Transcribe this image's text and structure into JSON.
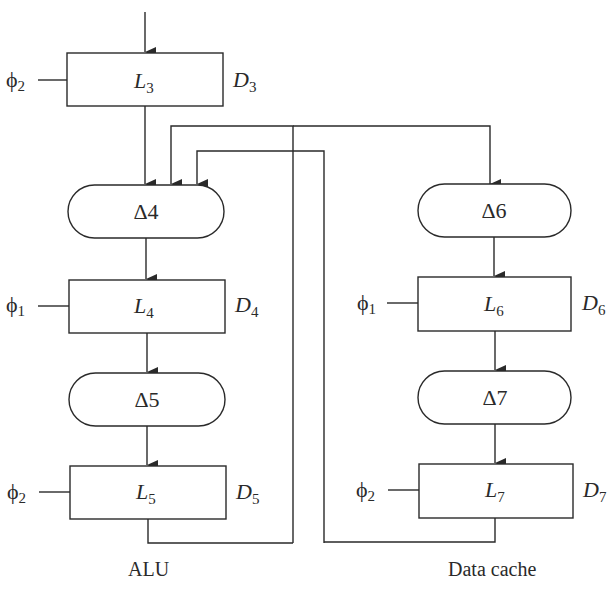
{
  "diagram": {
    "latches": [
      {
        "id": "L3",
        "label": "L",
        "sub": "3",
        "delay_label": "D",
        "delay_sub": "3",
        "clock": "ϕ",
        "clock_sub": "2"
      },
      {
        "id": "L4",
        "label": "L",
        "sub": "4",
        "delay_label": "D",
        "delay_sub": "4",
        "clock": "ϕ",
        "clock_sub": "1"
      },
      {
        "id": "L5",
        "label": "L",
        "sub": "5",
        "delay_label": "D",
        "delay_sub": "5",
        "clock": "ϕ",
        "clock_sub": "2"
      },
      {
        "id": "L6",
        "label": "L",
        "sub": "6",
        "delay_label": "D",
        "delay_sub": "6",
        "clock": "ϕ",
        "clock_sub": "1"
      },
      {
        "id": "L7",
        "label": "L",
        "sub": "7",
        "delay_label": "D",
        "delay_sub": "7",
        "clock": "ϕ",
        "clock_sub": "2"
      }
    ],
    "logic_blocks": [
      {
        "id": "d4",
        "label": "Δ4"
      },
      {
        "id": "d5",
        "label": "Δ5"
      },
      {
        "id": "d6",
        "label": "Δ6"
      },
      {
        "id": "d7",
        "label": "Δ7"
      }
    ],
    "group_labels": {
      "left": "ALU",
      "right": "Data cache"
    },
    "colors": {
      "stroke": "#2a2a2a",
      "background": "#ffffff"
    }
  }
}
